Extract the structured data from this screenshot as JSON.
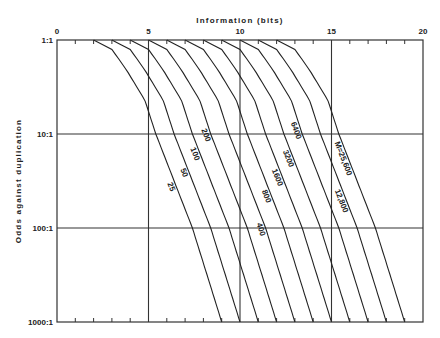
{
  "chart_data": {
    "type": "line",
    "title": "",
    "xlabel": "Information (bits)",
    "ylabel": "Odds against duplication",
    "xlim": [
      0,
      20
    ],
    "x_ticks": [
      0,
      5,
      10,
      15,
      20
    ],
    "x_minor_step": 1,
    "y_scale": "log",
    "y_ticks": [
      {
        "value": 1,
        "label": "1:1"
      },
      {
        "value": 10,
        "label": "10:1"
      },
      {
        "value": 100,
        "label": "100:1"
      },
      {
        "value": 1000,
        "label": "1000:1"
      }
    ],
    "ylim": [
      1,
      1000
    ],
    "grid": true,
    "curve_shape": {
      "description": "bits offset from curve start vs log10(odds)",
      "offset_bits": [
        0,
        1.0,
        1.8,
        2.8,
        3.4,
        4.4,
        5.4,
        6.2,
        7.0
      ],
      "log10_odds": [
        0,
        0.1,
        0.32,
        0.64,
        1.0,
        1.5,
        2.0,
        2.5,
        3.0
      ]
    },
    "series": [
      {
        "name": "25",
        "label": "25",
        "start_bits": 2,
        "end_bits": 9
      },
      {
        "name": "50",
        "label": "50",
        "start_bits": 3,
        "end_bits": 10
      },
      {
        "name": "100",
        "label": "100",
        "start_bits": 4,
        "end_bits": 11
      },
      {
        "name": "200",
        "label": "200",
        "start_bits": 5,
        "end_bits": 12
      },
      {
        "name": "400",
        "label": "400",
        "start_bits": 6,
        "end_bits": 13
      },
      {
        "name": "800",
        "label": "800",
        "start_bits": 7,
        "end_bits": 14
      },
      {
        "name": "1600",
        "label": "1600",
        "start_bits": 8,
        "end_bits": 15
      },
      {
        "name": "3200",
        "label": "3200",
        "start_bits": 9,
        "end_bits": 16
      },
      {
        "name": "6400",
        "label": "6400",
        "start_bits": 10,
        "end_bits": 17
      },
      {
        "name": "12800",
        "label": "12,800",
        "start_bits": 11,
        "end_bits": 18
      },
      {
        "name": "25600",
        "label": "M=25,600",
        "start_bits": 12,
        "end_bits": 19
      }
    ],
    "label_positions_log10_odds": {
      "25": 1.55,
      "50": 1.4,
      "100": 1.2,
      "200": 1.0,
      "400": 2.0,
      "800": 1.65,
      "1600": 1.45,
      "3200": 1.25,
      "6400": 0.95,
      "12800": 1.7,
      "25600": 1.25
    }
  }
}
